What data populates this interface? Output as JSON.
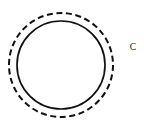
{
  "figure": {
    "background_color": "#ffffff",
    "stroke_color": "#111111",
    "width": 144,
    "height": 136,
    "center_x": 61,
    "center_y": 65,
    "shapes": {
      "inner_circle": {
        "name": "solid circle",
        "style": "solid",
        "radius": 44,
        "stroke_width": 1.7
      },
      "outer_circle": {
        "name": "dashed circle",
        "style": "dashed",
        "radius": 52,
        "stroke_width": 2,
        "dash_length": 6,
        "gap_length": 3.6
      }
    },
    "labels": {
      "c": {
        "text": "C",
        "x": 133,
        "y": 48
      }
    }
  }
}
